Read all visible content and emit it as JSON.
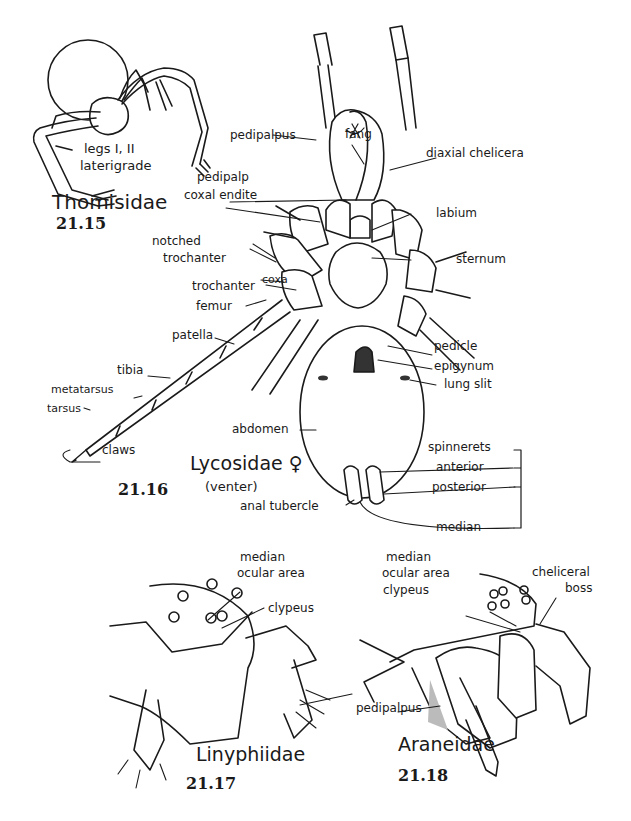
{
  "figures": [
    {
      "id": "21.15",
      "family": "Thomisidae",
      "labels": [
        "legs I, II",
        "laterigrade"
      ]
    },
    {
      "id": "21.16",
      "family": "Lycosidae ♀",
      "view": "(venter)",
      "labels": {
        "pedipalpus": "pedipalpus",
        "fang": "fang",
        "diaxial_chelicera": "diaxial chelicera",
        "pedipalp": "pedipalp",
        "coxal_endite": "coxal endite",
        "labium": "labium",
        "notched": "notched",
        "trochanter_notched": "trochanter",
        "sternum": "sternum",
        "coxa": "coxa",
        "trochanter": "trochanter",
        "femur": "femur",
        "patella": "patella",
        "tibia": "tibia",
        "metatarsus": "metatarsus",
        "tarsus": "tarsus",
        "claws": "claws",
        "pedicle": "pedicle",
        "epigynum": "epigynum",
        "lung_slit": "lung slit",
        "abdomen": "abdomen",
        "spinnerets": "spinnerets",
        "anterior": "anterior",
        "posterior": "posterior",
        "anal_tubercle": "anal tubercle",
        "median": "median"
      }
    },
    {
      "id": "21.17",
      "family": "Linyphiidae",
      "labels": {
        "median": "median",
        "ocular_area": "ocular area",
        "clypeus": "clypeus"
      }
    },
    {
      "id": "21.18",
      "family": "Araneidae",
      "labels": {
        "median": "median",
        "ocular_area": "ocular area",
        "clypeus": "clypeus",
        "cheliceral": "cheliceral",
        "boss": "boss",
        "pedipalpus": "pedipalpus"
      }
    }
  ]
}
